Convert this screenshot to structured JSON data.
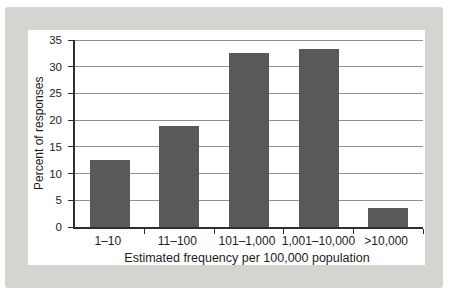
{
  "figure": {
    "frame_color": "#d4d5d1",
    "panel_color": "#ffffff"
  },
  "chart_data": {
    "type": "bar",
    "title": "",
    "categories": [
      "1–10",
      "11–100",
      "101–1,000",
      "1,001–10,000",
      ">10,000"
    ],
    "values": [
      12.5,
      19,
      32.5,
      33.3,
      3.5
    ],
    "xlabel": "Estimated frequency per 100,000 population",
    "ylabel": "Percent of responses",
    "ylim": [
      0,
      35
    ],
    "yticks": [
      0,
      5,
      10,
      15,
      20,
      25,
      30,
      35
    ],
    "grid": "horizontal",
    "legend": "none",
    "bar_color": "#58595b",
    "axis_color": "#2e2e2e",
    "gridline_color": "#8f8f8f",
    "text_color": "#1c1c1c"
  }
}
